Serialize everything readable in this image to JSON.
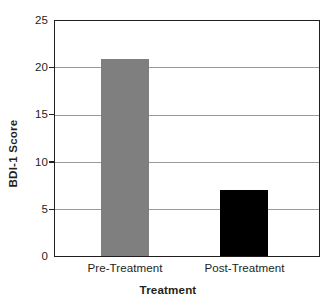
{
  "chart_data": {
    "type": "bar",
    "title": "",
    "xlabel": "Treatment",
    "ylabel": "BDI-1 Score",
    "categories": [
      "Pre-Treatment",
      "Post-Treatment"
    ],
    "values": [
      21,
      7
    ],
    "bar_colors": [
      "#7f7f7f",
      "#000000"
    ],
    "ylim": [
      0,
      25
    ],
    "yticks": [
      0,
      5,
      10,
      15,
      20,
      25
    ],
    "ytick_labels": [
      "0",
      "5",
      "10",
      "15",
      "20",
      "25"
    ],
    "grid": true,
    "grid_axis": "y",
    "legend": false,
    "legend_position": "none",
    "annotations": []
  },
  "axes": {
    "y_title": "BDI-1 Score",
    "x_title": "Treatment",
    "y_tick_labels": [
      "25",
      "20",
      "15",
      "10",
      "5",
      "0"
    ],
    "x_tick_labels": [
      "Pre-Treatment",
      "Post-Treatment"
    ]
  },
  "series": {
    "bars": [
      {
        "label": "Pre-Treatment",
        "value": 21,
        "color": "#7f7f7f"
      },
      {
        "label": "Post-Treatment",
        "value": 7,
        "color": "#000000"
      }
    ]
  },
  "colors": {
    "axis": "#231f20",
    "grid": "#9a9a9a",
    "background": "#ffffff",
    "bar_gray": "#7f7f7f",
    "bar_black": "#000000"
  }
}
